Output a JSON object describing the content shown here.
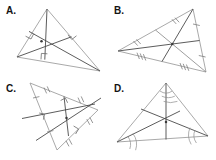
{
  "figure": {
    "background_color": "#ffffff",
    "width": 216,
    "height": 160,
    "side_color": "#9a9a9a",
    "cevian_color": "#4a4a4a",
    "mark_color": "#7d7d7d",
    "label_color": "#141414"
  },
  "panels": [
    {
      "key": "a",
      "label": "A.",
      "construction": "altitudes",
      "center_name": "orthocenter",
      "marks": "right-angle squares",
      "mark_count": 3,
      "center_inside": true,
      "vertices": [
        [
          47,
          9
        ],
        [
          17,
          57
        ],
        [
          100,
          71
        ]
      ],
      "feet": [
        [
          44.8,
          59.6
        ],
        [
          29.0,
          31.4
        ],
        [
          71.5,
          36.8
        ]
      ],
      "center": [
        41.5,
        41.2
      ]
    },
    {
      "key": "b",
      "label": "B.",
      "construction": "medians",
      "center_name": "centroid",
      "marks": "congruence ticks",
      "mark_count": 6,
      "center_inside": true,
      "vertices": [
        [
          85,
          9
        ],
        [
          10,
          51
        ],
        [
          98,
          72
        ]
      ],
      "midpoints": [
        [
          54.0,
          61.5
        ],
        [
          91.5,
          40.5
        ],
        [
          47.5,
          30.0
        ]
      ],
      "center": [
        64.3,
        44.0
      ]
    },
    {
      "key": "c",
      "label": "C.",
      "construction": "perpendicular bisectors",
      "center_name": "circumcenter",
      "marks": "ticks and right-angle squares",
      "mark_count": 6,
      "center_inside": false,
      "vertices": [
        [
          30,
          5
        ],
        [
          57,
          72
        ],
        [
          98,
          32
        ]
      ],
      "midpoints": [
        [
          43.5,
          38.5
        ],
        [
          77.5,
          52.0
        ],
        [
          64.0,
          18.5
        ]
      ],
      "center": [
        66.5,
        40.0
      ]
    },
    {
      "key": "d",
      "label": "D.",
      "construction": "angle bisectors",
      "center_name": "incenter",
      "marks": "angle arcs",
      "mark_count": 6,
      "center_inside": true,
      "vertices": [
        [
          58,
          5
        ],
        [
          9,
          64
        ],
        [
          100,
          58
        ]
      ],
      "opposite_points": [
        [
          58,
          61.5
        ],
        [
          72.0,
          33.0
        ],
        [
          33.0,
          31.0
        ]
      ],
      "center": [
        58.0,
        44.0
      ]
    }
  ]
}
